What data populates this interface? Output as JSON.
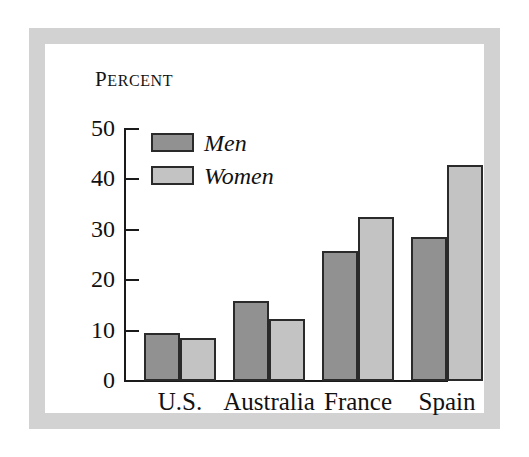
{
  "figure": {
    "frame_color": "#d2d2d2",
    "background_color": "#ffffff"
  },
  "chart_data": {
    "type": "bar",
    "title": "",
    "ylabel": "Percent",
    "xlabel": "",
    "ylim": [
      0,
      50
    ],
    "yticks": [
      0,
      10,
      20,
      30,
      40,
      50
    ],
    "ytick_labels": [
      "0",
      "10",
      "20",
      "30",
      "40",
      "50"
    ],
    "grid": false,
    "legend_position": "upper left",
    "categories": [
      "U.S.",
      "Australia",
      "France",
      "Spain"
    ],
    "series": [
      {
        "name": "Men",
        "color": "#919191",
        "values": [
          9.5,
          15.8,
          25.8,
          28.5
        ]
      },
      {
        "name": "Women",
        "color": "#c3c3c3",
        "values": [
          8.6,
          12.4,
          32.6,
          42.8
        ]
      }
    ]
  },
  "axis_title": {
    "first_letter": "P",
    "rest": "ERCENT"
  },
  "legend": {
    "items": [
      {
        "label": "Men",
        "swatch": "men-swatch"
      },
      {
        "label": "Women",
        "swatch": "women-swatch"
      }
    ]
  }
}
